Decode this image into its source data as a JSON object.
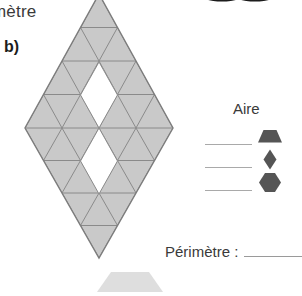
{
  "page": {
    "width": 285,
    "height": 289,
    "background": "#ffffff",
    "cut_off_heading": "mètre",
    "item_label": "b)"
  },
  "figure": {
    "name": "rhombus-triangle-grid",
    "fill_color": "#c9c9c9",
    "stroke_color": "#8a8a8a",
    "hole_color": "#ffffff",
    "outline_color": "#7d7d7d",
    "center_x": 99,
    "top_y": -6,
    "bottom_y": 258,
    "left_x": 25,
    "right_x": 173,
    "mid_y": 128,
    "cell_width": 37,
    "row_height": 33,
    "holes": [
      {
        "name": "upper-hole",
        "cx": 99,
        "cy": 95,
        "rx": 18.5,
        "ry": 33
      },
      {
        "name": "lower-hole",
        "cx": 99,
        "cy": 161,
        "rx": 18.5,
        "ry": 33
      }
    ]
  },
  "legend": {
    "title": "Aire",
    "title_color": "#3a3a3a",
    "shape_color": "#555555",
    "rule_color": "#a9a9a9",
    "rows": [
      {
        "shape": "trapezoid",
        "icon_name": "trapezoid-shape-icon",
        "answer": ""
      },
      {
        "shape": "rhombus",
        "icon_name": "rhombus-shape-icon",
        "answer": ""
      },
      {
        "shape": "hexagon",
        "icon_name": "hexagon-shape-icon",
        "answer": ""
      }
    ]
  },
  "perimeter": {
    "label": "Périmètre :",
    "answer": "",
    "rule_color": "#9a9a9a"
  },
  "decorations": {
    "photo_legs": {
      "name": "photo-legs-crop",
      "color": "#2b2b2b",
      "count": 2
    },
    "bottom_trapezoid": {
      "name": "bottom-trapezoid-crop",
      "color": "#dedede"
    }
  }
}
